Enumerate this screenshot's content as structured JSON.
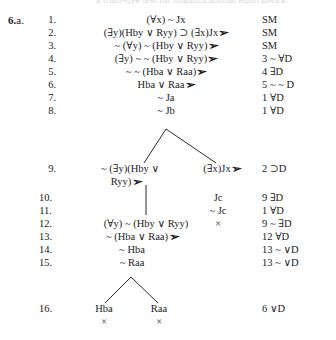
{
  "problem": {
    "number": "6.",
    "part": "a."
  },
  "symbols": {
    "check": "➢",
    "closed": "×"
  },
  "top_sliver": "a truth-tree test for quantificational equivalence",
  "proof": {
    "lines": [
      {
        "number": "1.",
        "formula": "(∀x) ~ Jx",
        "checked": false,
        "justification": "SM"
      },
      {
        "number": "2.",
        "formula": "(∃y)(Hby ∨ Ryy) ⊃ (∃x)Jx",
        "checked": true,
        "justification": "SM"
      },
      {
        "number": "3.",
        "formula": "~ (∀y) ~ (Hby ∨ Ryy)",
        "checked": true,
        "justification": "SM"
      },
      {
        "number": "4.",
        "formula": "(∃y) ~ ~ (Hby ∨ Ryy)",
        "checked": true,
        "justification": "3 ~ ∀D"
      },
      {
        "number": "5.",
        "formula": "~ ~ (Hba ∨ Raa)",
        "checked": true,
        "justification": "4 ∃D"
      },
      {
        "number": "6.",
        "formula": "Hba ∨ Raa",
        "checked": true,
        "justification": "5 ~ ~ D"
      },
      {
        "number": "7.",
        "formula": "~ Ja",
        "checked": false,
        "justification": "1 ∀D"
      },
      {
        "number": "8.",
        "formula": "~ Jb",
        "checked": false,
        "justification": "1 ∀D"
      },
      {
        "number": "9.",
        "formula_left_line1": "~ (∃y)(Hby ∨",
        "formula_left_line2": "Ryy)",
        "formula_left_checked": true,
        "formula_right": "(∃x)Jx",
        "formula_right_checked": true,
        "justification": "2 ⊃D"
      },
      {
        "number": "10.",
        "formula_right": "Jc",
        "justification": "9 ∃D"
      },
      {
        "number": "11.",
        "formula_right": "~ Jc",
        "justification": "1 ∀D"
      },
      {
        "number": "12.",
        "formula_left": "(∀y) ~ (Hby ∨ Ryy)",
        "formula_right_closed": "×",
        "justification": "9 ~ ∃D"
      },
      {
        "number": "13.",
        "formula_left": "~ (Hba ∨ Raa)",
        "formula_left_checked": true,
        "justification": "12 ∀D"
      },
      {
        "number": "14.",
        "formula_left": "~ Hba",
        "justification": "13 ~ ∨D"
      },
      {
        "number": "15.",
        "formula_left": "~ Raa",
        "justification": "13 ~ ∨D"
      },
      {
        "number": "16.",
        "formula_branch_left": "Hba",
        "formula_branch_left_closed": "×",
        "formula_branch_right": "Raa",
        "formula_branch_right_closed": "×",
        "justification": "6 ∨D"
      }
    ]
  }
}
